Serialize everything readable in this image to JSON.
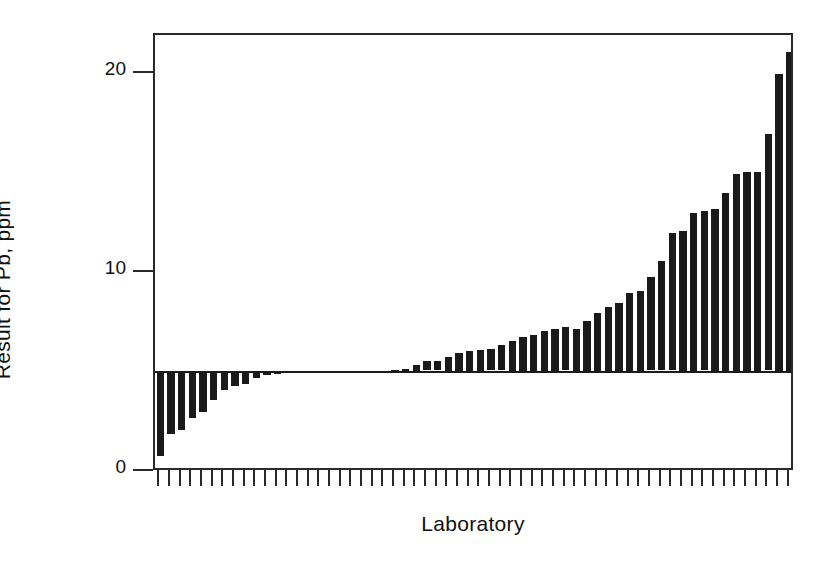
{
  "chart_data": {
    "type": "bar",
    "title": "",
    "subtitle": "",
    "xlabel": "Laboratory",
    "ylabel": "Result for Pb, ppm",
    "ylim": [
      0,
      22.5
    ],
    "yticks": [
      0,
      10,
      20
    ],
    "ytick_labels": [
      "0",
      "10",
      "20"
    ],
    "grid": false,
    "legend": null,
    "baseline": 5.1,
    "baseline_note": "Bars are drawn as deviations from a horizontal consensus reference line at about 5 ppm",
    "bar_color": "#1a1a1a",
    "axis_color": "#2a2a2a",
    "n_categories": 60,
    "categories": [
      "1",
      "2",
      "3",
      "4",
      "5",
      "6",
      "7",
      "8",
      "9",
      "10",
      "11",
      "12",
      "13",
      "14",
      "15",
      "16",
      "17",
      "18",
      "19",
      "20",
      "21",
      "22",
      "23",
      "24",
      "25",
      "26",
      "27",
      "28",
      "29",
      "30",
      "31",
      "32",
      "33",
      "34",
      "35",
      "36",
      "37",
      "38",
      "39",
      "40",
      "41",
      "42",
      "43",
      "44",
      "45",
      "46",
      "47",
      "48",
      "49",
      "50",
      "51",
      "52",
      "53",
      "54",
      "55",
      "56",
      "57",
      "58",
      "59",
      "60"
    ],
    "xtick_labels": [],
    "values": [
      0.8,
      1.9,
      2.1,
      2.7,
      3.0,
      3.6,
      4.1,
      4.3,
      4.4,
      4.7,
      4.85,
      4.9,
      4.95,
      4.95,
      5.0,
      5.0,
      5.0,
      5.05,
      5.05,
      5.05,
      5.1,
      5.1,
      5.15,
      5.2,
      5.4,
      5.6,
      5.6,
      5.8,
      6.0,
      6.1,
      6.15,
      6.2,
      6.4,
      6.6,
      6.8,
      6.9,
      7.1,
      7.2,
      7.3,
      7.2,
      7.6,
      8.0,
      8.3,
      8.5,
      9.0,
      9.1,
      9.8,
      10.6,
      12.0,
      12.1,
      13.0,
      13.1,
      13.2,
      14.0,
      15.0,
      15.1,
      15.1,
      17.0,
      20.0,
      21.1
    ],
    "value_unit": "ppm",
    "max_value": 21.1,
    "min_value": 0.8
  },
  "axes": {
    "y_title": "Result for Pb, ppm",
    "x_title": "Laboratory"
  }
}
